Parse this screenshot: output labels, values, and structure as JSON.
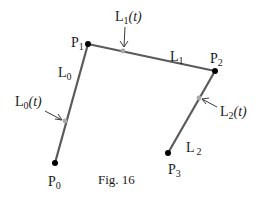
{
  "figure": {
    "caption": "Fig. 16",
    "points": [
      {
        "id": "P0",
        "base": "P",
        "sub": "0",
        "x": 55,
        "y": 163
      },
      {
        "id": "P1",
        "base": "P",
        "sub": "1",
        "x": 88,
        "y": 44
      },
      {
        "id": "P2",
        "base": "P",
        "sub": "2",
        "x": 215,
        "y": 71
      },
      {
        "id": "P3",
        "base": "P",
        "sub": "3",
        "x": 168,
        "y": 153
      }
    ],
    "segments": [
      {
        "id": "L0",
        "base": "L",
        "sub": "0",
        "from": "P0",
        "to": "P1"
      },
      {
        "id": "L1",
        "base": "L",
        "sub": "1",
        "from": "P1",
        "to": "P2"
      },
      {
        "id": "L2",
        "base": "L",
        "sub": "2",
        "from": "P3",
        "to": "P2"
      }
    ],
    "interpolants": [
      {
        "id": "L0(t)",
        "base": "L",
        "sub": "0",
        "arg": "(t)",
        "x": 65,
        "y": 121
      },
      {
        "id": "L1(t)",
        "base": "L",
        "sub": "1",
        "arg": "(t)",
        "x": 123,
        "y": 51
      },
      {
        "id": "L2(t)",
        "base": "L",
        "sub": "2",
        "arg": "(t)",
        "x": 199,
        "y": 98
      }
    ],
    "colors": {
      "line": "#5a5a5a",
      "point": "#000000",
      "marker": "#a8a8a8",
      "text": "#1a1a1a"
    }
  }
}
